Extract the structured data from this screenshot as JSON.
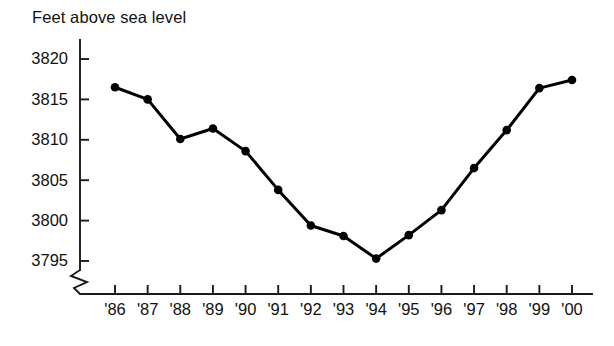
{
  "chart_data": {
    "type": "line",
    "title": "Feet above sea level",
    "xlabel": "",
    "ylabel": "Feet above sea level",
    "categories": [
      "'86",
      "'87",
      "'88",
      "'89",
      "'90",
      "'91",
      "'92",
      "'93",
      "'94",
      "'95",
      "'96",
      "'97",
      "'98",
      "'99",
      "'00"
    ],
    "values": [
      3816.5,
      3815.0,
      3810.1,
      3811.4,
      3808.6,
      3803.8,
      3799.4,
      3798.1,
      3795.3,
      3798.2,
      3801.3,
      3806.5,
      3811.2,
      3816.4,
      3817.4
    ],
    "ylim": [
      3793.0,
      3821.5
    ],
    "y_ticks": [
      3795,
      3800,
      3805,
      3810,
      3815,
      3820
    ],
    "y_tick_labels": [
      "3795",
      "3800",
      "3805",
      "3810",
      "3815",
      "3820"
    ],
    "x_tick_labels": [
      "'86",
      "'87",
      "'88",
      "'89",
      "'90",
      "'91",
      "'92",
      "'93",
      "'94",
      "'95",
      "'96",
      "'97",
      "'98",
      "'99",
      "'00"
    ],
    "grid": false,
    "legend": null,
    "axis_break": true,
    "marker": "filled-circle",
    "line_color": "#000000",
    "axis_color": "#1a1a1a",
    "background_color": "#ffffff"
  }
}
